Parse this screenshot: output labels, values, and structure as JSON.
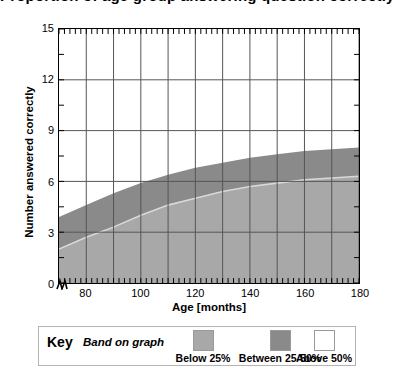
{
  "chart_data": {
    "type": "area",
    "title": "Proportion of age group answering question correctly",
    "xlabel": "Age [months]",
    "ylabel": "Number answered correctly",
    "xlim": [
      70,
      180
    ],
    "ylim": [
      0,
      15
    ],
    "xticks": [
      80,
      100,
      120,
      140,
      160,
      180
    ],
    "yticks": [
      0,
      3,
      6,
      9,
      12,
      15
    ],
    "x_minor_tick_interval": 2,
    "y_minor_tick_interval": 1.5,
    "x_gridline_interval": 10,
    "grid": true,
    "axis_break_at_origin": true,
    "legend_position": "below-plot",
    "x": [
      70,
      80,
      90,
      100,
      110,
      120,
      130,
      140,
      150,
      160,
      170,
      180
    ],
    "series": [
      {
        "name": "Below 25%",
        "description": "Lower band boundary: 25th percentile curve",
        "values": [
          2.0,
          2.7,
          3.3,
          4.0,
          4.6,
          5.0,
          5.4,
          5.7,
          5.9,
          6.1,
          6.2,
          6.3
        ]
      },
      {
        "name": "Between 25-50%",
        "description": "Upper band boundary: 50th percentile curve",
        "values": [
          3.9,
          4.6,
          5.3,
          5.9,
          6.4,
          6.8,
          7.1,
          7.4,
          7.6,
          7.8,
          7.9,
          8.0
        ]
      },
      {
        "name": "Above 50%",
        "description": "Unshaded region above the 50th percentile curve",
        "values": [
          15,
          15,
          15,
          15,
          15,
          15,
          15,
          15,
          15,
          15,
          15,
          15
        ]
      }
    ],
    "colors": {
      "below_25": "#a8a8a8",
      "between_25_50": "#8a8a8a",
      "above_50": "#ffffff",
      "axis": "#000000",
      "gridline": "#555555",
      "boundary_line": "#d8d8d8"
    }
  },
  "legend": {
    "key_label": "Key",
    "caption": "Band on graph",
    "items": [
      {
        "label": "Below 25%",
        "color": "#a8a8a8"
      },
      {
        "label": "Between 25-50%",
        "color": "#8a8a8a"
      },
      {
        "label": "Above 50%",
        "color": "#ffffff"
      }
    ]
  }
}
